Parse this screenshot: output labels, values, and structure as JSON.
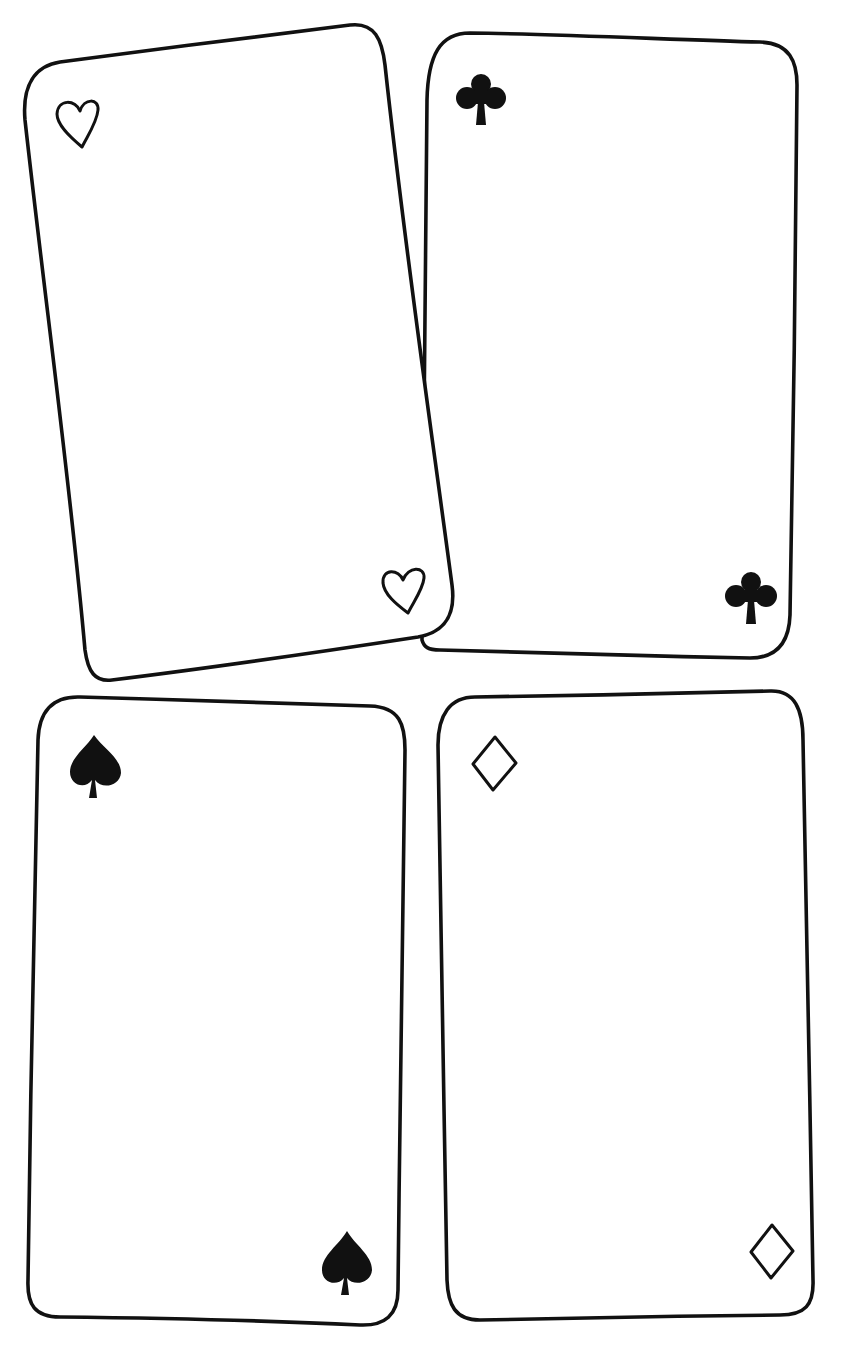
{
  "page": {
    "description": "Four blank hand-drawn playing card templates"
  },
  "cards": [
    {
      "id": "hearts",
      "suit": "hearts",
      "pip_icon": "heart-outline-icon",
      "style": "outline",
      "position": "top-left",
      "tilt": "rotated"
    },
    {
      "id": "clubs",
      "suit": "clubs",
      "pip_icon": "club-solid-icon",
      "style": "solid",
      "position": "top-right",
      "tilt": "upright"
    },
    {
      "id": "spades",
      "suit": "spades",
      "pip_icon": "spade-solid-icon",
      "style": "solid",
      "position": "bottom-left",
      "tilt": "upright"
    },
    {
      "id": "diamonds",
      "suit": "diamonds",
      "pip_icon": "diamond-outline-icon",
      "style": "outline",
      "position": "bottom-right",
      "tilt": "upright"
    }
  ],
  "colors": {
    "ink": "#111111",
    "paper": "#ffffff"
  }
}
